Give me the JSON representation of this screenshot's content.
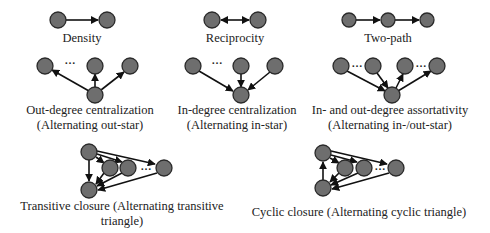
{
  "diagram": {
    "panels": [
      {
        "id": "density",
        "label_lines": [
          "Density"
        ]
      },
      {
        "id": "reciprocity",
        "label_lines": [
          "Reciprocity"
        ]
      },
      {
        "id": "two-path",
        "label_lines": [
          "Two-path"
        ]
      },
      {
        "id": "out-star",
        "label_lines": [
          "Out-degree centralization",
          "(Alternating out-star)"
        ]
      },
      {
        "id": "in-star",
        "label_lines": [
          "In-degree centralization",
          "(Alternating in-star)"
        ]
      },
      {
        "id": "in-out-star",
        "label_lines": [
          "In- and out-degree assortativity",
          "(Alternating in-/out-star)"
        ]
      },
      {
        "id": "transitive-triangle",
        "label_lines": [
          "Transitive closure (Alternating transitive",
          "triangle)"
        ]
      },
      {
        "id": "cyclic-triangle",
        "label_lines": [
          "Cyclic closure (Alternating cyclic triangle)"
        ]
      }
    ],
    "ellipsis": "…",
    "colors": {
      "node_fill": "#6e6e6e",
      "node_stroke": "#2a2a2a",
      "edge": "#111111",
      "text": "#222222",
      "background": "#ffffff"
    }
  }
}
